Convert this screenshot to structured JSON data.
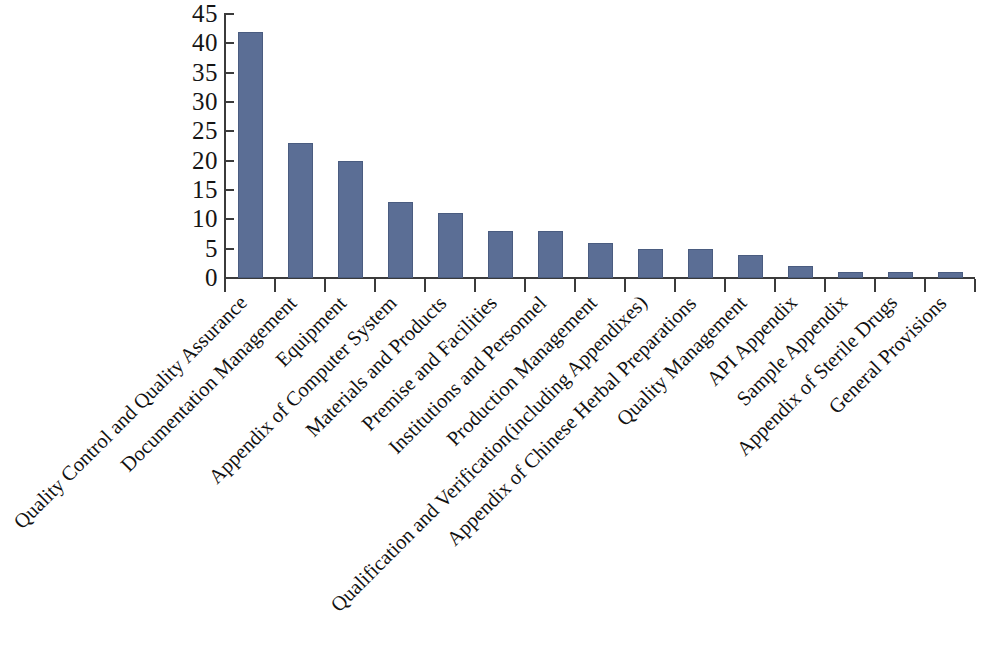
{
  "chart_data": {
    "type": "bar",
    "title": "",
    "subtitle": "",
    "xlabel": "",
    "ylabel": "",
    "ylim": [
      0,
      45
    ],
    "y_ticks": [
      0,
      5,
      10,
      15,
      20,
      25,
      30,
      35,
      40,
      45
    ],
    "grid": false,
    "legend": false,
    "legend_position": "none",
    "orientation": "vertical",
    "bar_color": "#5b6e95",
    "axis_color": "#3b3b3b",
    "background_color": "#ffffff",
    "x_tick_label_rotation": -45,
    "categories": [
      "Quality Control and Quality Assurance",
      "Documentation Management",
      "Equipment",
      "Appendix of Computer System",
      "Materials and Products",
      "Premise and Facilities",
      "Institutions and Personnel",
      "Production Management",
      "Qualification and Verification(including Appendixes)",
      "Appendix of Chinese Herbal Preparations",
      "Quality Management",
      "API Appendix",
      "Sample Appendix",
      "Appendix of Sterile Drugs",
      "General Provisions"
    ],
    "values": [
      42,
      23,
      20,
      13,
      11,
      8,
      8,
      6,
      5,
      5,
      4,
      2,
      1,
      1,
      1
    ],
    "series": [
      {
        "name": "Count",
        "values": [
          42,
          23,
          20,
          13,
          11,
          8,
          8,
          6,
          5,
          5,
          4,
          2,
          1,
          1,
          1
        ]
      }
    ]
  }
}
